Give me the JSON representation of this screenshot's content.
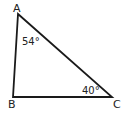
{
  "diagram": {
    "type": "triangle",
    "stroke_color": "#1a1a1a",
    "label_color": "#333333",
    "vertices": [
      {
        "name": "A",
        "x": 18,
        "y": 14
      },
      {
        "name": "B",
        "x": 13,
        "y": 97
      },
      {
        "name": "C",
        "x": 112,
        "y": 97
      }
    ],
    "angles": [
      {
        "vertex": "A",
        "label": "54°"
      },
      {
        "vertex": "C",
        "label": "40°"
      }
    ]
  }
}
